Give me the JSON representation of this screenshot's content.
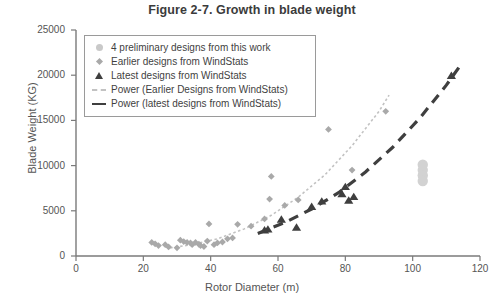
{
  "chart_data": {
    "type": "scatter",
    "title": "Figure 2-7. Growth in blade weight",
    "xlabel": "Rotor Diameter (m)",
    "ylabel": "Blade Weight (KG)",
    "xlim": [
      0,
      120
    ],
    "ylim": [
      0,
      25000
    ],
    "xticks": [
      0,
      20,
      40,
      60,
      80,
      100,
      120
    ],
    "yticks": [
      0,
      5000,
      10000,
      15000,
      20000,
      25000
    ],
    "grid": false,
    "legend_position": "top-left-inside",
    "legend": [
      {
        "label": "4 preliminary designs from this work",
        "marker": "circle",
        "color": "#c9c9c9"
      },
      {
        "label": "Earlier designs from WindStats",
        "marker": "diamond",
        "color": "#a9a9a9"
      },
      {
        "label": "Latest designs from WindStats",
        "marker": "triangle",
        "color": "#3f3f3f"
      },
      {
        "label": "Power (Earlier Designs from WindStats)",
        "marker": "dashed-line",
        "color": "#c2c2c2"
      },
      {
        "label": "Power (latest designs from WindStats)",
        "marker": "dashed-line-bold",
        "color": "#3f3f3f"
      }
    ],
    "series": [
      {
        "name": "4 preliminary designs from this work",
        "marker": "circle",
        "color": "#d2d2d2",
        "points": [
          [
            103,
            10100
          ],
          [
            103,
            9500
          ],
          [
            103,
            8900
          ],
          [
            103,
            8300
          ]
        ]
      },
      {
        "name": "Earlier designs from WindStats",
        "marker": "diamond",
        "color": "#a9a9a9",
        "points": [
          [
            22.5,
            1500
          ],
          [
            23.5,
            1350
          ],
          [
            24.5,
            1150
          ],
          [
            26.5,
            1250
          ],
          [
            27.5,
            1000
          ],
          [
            30.0,
            900
          ],
          [
            31.0,
            1750
          ],
          [
            32.0,
            1600
          ],
          [
            33.0,
            1500
          ],
          [
            34.0,
            1450
          ],
          [
            34.5,
            1250
          ],
          [
            35.5,
            1500
          ],
          [
            36.5,
            1300
          ],
          [
            37.0,
            1150
          ],
          [
            38.0,
            1050
          ],
          [
            39.0,
            1650
          ],
          [
            39.5,
            3550
          ],
          [
            41.0,
            1250
          ],
          [
            42.0,
            1450
          ],
          [
            43.5,
            1550
          ],
          [
            45.0,
            1900
          ],
          [
            46.5,
            2000
          ],
          [
            48.0,
            3500
          ],
          [
            52.0,
            3300
          ],
          [
            56.0,
            4100
          ],
          [
            57.5,
            6300
          ],
          [
            58.0,
            8800
          ],
          [
            62.0,
            5600
          ],
          [
            66.0,
            6200
          ],
          [
            75.0,
            14000
          ],
          [
            82.0,
            9500
          ],
          [
            92.0,
            16000
          ]
        ]
      },
      {
        "name": "Latest designs from WindStats",
        "marker": "triangle",
        "color": "#3f3f3f",
        "points": [
          [
            56.0,
            2900
          ],
          [
            57.0,
            3000
          ],
          [
            61.0,
            4100
          ],
          [
            65.5,
            3200
          ],
          [
            70.0,
            5500
          ],
          [
            73.0,
            6100
          ],
          [
            79.0,
            6900
          ],
          [
            80.0,
            7700
          ],
          [
            81.0,
            6200
          ],
          [
            82.5,
            6600
          ],
          [
            111.5,
            20000
          ]
        ]
      }
    ],
    "trendlines": [
      {
        "name": "Power (Earlier Designs from WindStats)",
        "style": "dotted",
        "color": "#c2c2c2",
        "points": [
          [
            28,
            900
          ],
          [
            35,
            1300
          ],
          [
            42,
            1900
          ],
          [
            50,
            3000
          ],
          [
            58,
            4500
          ],
          [
            66,
            6500
          ],
          [
            74,
            9000
          ],
          [
            82,
            12200
          ],
          [
            90,
            16000
          ],
          [
            93,
            17800
          ]
        ]
      },
      {
        "name": "Power (latest designs from WindStats)",
        "style": "dashed-bold",
        "color": "#3f3f3f",
        "points": [
          [
            54,
            2500
          ],
          [
            62,
            3700
          ],
          [
            70,
            5200
          ],
          [
            78,
            7000
          ],
          [
            86,
            9300
          ],
          [
            94,
            12000
          ],
          [
            102,
            15200
          ],
          [
            110,
            18900
          ],
          [
            114,
            21000
          ]
        ]
      }
    ]
  },
  "axis": {
    "yticks_text": [
      "25000",
      "20000",
      "15000",
      "10000",
      "5000",
      "0"
    ],
    "xticks_text": [
      "0",
      "20",
      "40",
      "60",
      "80",
      "100",
      "120"
    ]
  }
}
